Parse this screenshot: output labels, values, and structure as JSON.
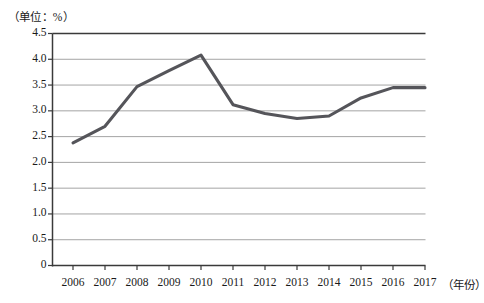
{
  "chart_data": {
    "type": "line",
    "title": "",
    "unit_note": "（单位：%）",
    "xlabel": "（年份）",
    "ylabel": "",
    "categories": [
      "2006",
      "2007",
      "2008",
      "2009",
      "2010",
      "2011",
      "2012",
      "2013",
      "2014",
      "2015",
      "2016",
      "2017"
    ],
    "x": [
      2006,
      2007,
      2008,
      2009,
      2010,
      2011,
      2012,
      2013,
      2014,
      2015,
      2016,
      2017
    ],
    "values": [
      2.38,
      2.7,
      3.47,
      3.78,
      4.08,
      3.12,
      2.95,
      2.85,
      2.9,
      3.25,
      3.45,
      3.45
    ],
    "ylim": [
      0,
      4.5
    ],
    "yticks": [
      0,
      0.5,
      1.0,
      1.5,
      2.0,
      2.5,
      3.0,
      3.5,
      4.0,
      4.5
    ],
    "ytick_labels": [
      "0",
      "0.5",
      "1.0",
      "1.5",
      "2.0",
      "2.5",
      "3.0",
      "3.5",
      "4.0",
      "4.5"
    ],
    "grid": true,
    "legend": "none",
    "line_color": "#55555a",
    "grid_color": "#9a9a9a",
    "axis_color": "#3a3a3a"
  },
  "axes": {
    "y_unit_caption": "（单位：%）",
    "x_axis_caption": "（年份）"
  }
}
